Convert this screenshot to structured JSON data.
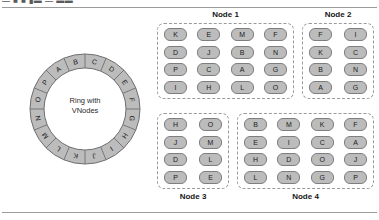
{
  "figure": {
    "top_fragment": "— ■ ■ ▮▬ — ▬▬",
    "ring": {
      "center_label_line1": "Ring with",
      "center_label_line2": "VNodes",
      "segments": [
        "A",
        "B",
        "C",
        "D",
        "E",
        "F",
        "G",
        "H",
        "I",
        "J",
        "K",
        "L",
        "M",
        "N",
        "O",
        "P"
      ],
      "segment_count": 16,
      "fill_color": "#bcbcbc",
      "stroke_color": "#6f6f6f"
    },
    "nodes": [
      {
        "id": "node1",
        "title": "Node 1",
        "title_position": "above",
        "columns": 4,
        "rows": [
          [
            "K",
            "E",
            "M",
            "F"
          ],
          [
            "D",
            "J",
            "B",
            "N"
          ],
          [
            "P",
            "C",
            "A",
            "G"
          ],
          [
            "I",
            "H",
            "L",
            "O"
          ]
        ]
      },
      {
        "id": "node2",
        "title": "Node 2",
        "title_position": "above",
        "columns": 2,
        "rows": [
          [
            "F",
            "I"
          ],
          [
            "K",
            "C"
          ],
          [
            "B",
            "N"
          ],
          [
            "A",
            "G"
          ]
        ]
      },
      {
        "id": "node3",
        "title": "Node 3",
        "title_position": "below",
        "columns": 2,
        "rows": [
          [
            "H",
            "O"
          ],
          [
            "J",
            "M"
          ],
          [
            "D",
            "L"
          ],
          [
            "P",
            "E"
          ]
        ]
      },
      {
        "id": "node4",
        "title": "Node 4",
        "title_position": "below",
        "columns": 4,
        "rows": [
          [
            "B",
            "M",
            "K",
            "F"
          ],
          [
            "E",
            "I",
            "C",
            "A"
          ],
          [
            "H",
            "D",
            "O",
            "J"
          ],
          [
            "L",
            "N",
            "G",
            "P"
          ]
        ]
      }
    ],
    "colors": {
      "vnode_fill": "#bcbcbc",
      "vnode_stroke": "#7e7e7e",
      "panel_border": "#9a9a9a",
      "rule": "#9a9a9a",
      "text": "#1a1a1a"
    }
  }
}
